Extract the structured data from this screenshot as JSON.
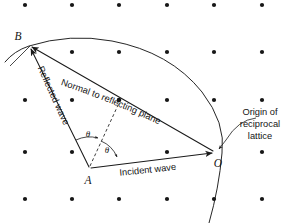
{
  "figure": {
    "background_color": "#ffffff",
    "ink_color": "#1a1a1a",
    "width": 293,
    "height": 223
  },
  "labels": {
    "point_b": "B",
    "point_a": "A",
    "point_o": "O",
    "theta_upper": "θ",
    "theta_lower": "θ",
    "normal_to_reflecting_plane": "Normal to reflecting plane",
    "reflected_wave": "Reflected wave",
    "incident_wave": "Incident wave",
    "origin_line_1": "Origin of",
    "origin_line_2": "reciprocal",
    "origin_line_3": "lattice"
  },
  "geometry": {
    "point_a": {
      "x": 90,
      "y": 168
    },
    "point_b": {
      "x": 29,
      "y": 46
    },
    "point_o": {
      "x": 215,
      "y": 152
    },
    "reflecting_plane_point": {
      "x": 119,
      "y": 105
    },
    "sphere_arc_path": "M 5,62 Q 14,51 29,46 Q 70,33 110,40 Q 168,50 201,91 Q 225,121 222,152 Q 219,186 209,223",
    "incident_wave_vector": {
      "from": "A",
      "to": "O"
    },
    "reflected_wave_vector": {
      "from": "A",
      "to": "B"
    },
    "normal_vector": {
      "from": "O",
      "to": "B"
    },
    "dashed_bisector": {
      "from": "A",
      "to": "reflecting_plane_point"
    }
  },
  "lattice": {
    "description": "Reciprocal lattice points arranged on a rectangular grid",
    "columns_x": [
      25,
      72,
      119,
      167,
      214,
      262
    ],
    "rows_y": [
      5,
      52,
      100,
      152,
      199
    ],
    "dot_radius": 2.1,
    "points": [
      {
        "x": 25,
        "y": 5
      },
      {
        "x": 72,
        "y": 5
      },
      {
        "x": 119,
        "y": 5
      },
      {
        "x": 167,
        "y": 5
      },
      {
        "x": 214,
        "y": 5
      },
      {
        "x": 262,
        "y": 5
      },
      {
        "x": 72,
        "y": 52
      },
      {
        "x": 119,
        "y": 52
      },
      {
        "x": 167,
        "y": 52
      },
      {
        "x": 214,
        "y": 52
      },
      {
        "x": 262,
        "y": 52
      },
      {
        "x": 25,
        "y": 100
      },
      {
        "x": 72,
        "y": 100
      },
      {
        "x": 119,
        "y": 100
      },
      {
        "x": 167,
        "y": 100
      },
      {
        "x": 214,
        "y": 100
      },
      {
        "x": 262,
        "y": 100
      },
      {
        "x": 25,
        "y": 152
      },
      {
        "x": 72,
        "y": 152
      },
      {
        "x": 167,
        "y": 152
      },
      {
        "x": 262,
        "y": 152
      },
      {
        "x": 25,
        "y": 199
      },
      {
        "x": 72,
        "y": 199
      },
      {
        "x": 119,
        "y": 199
      },
      {
        "x": 167,
        "y": 199
      },
      {
        "x": 214,
        "y": 199
      },
      {
        "x": 262,
        "y": 199
      }
    ]
  }
}
